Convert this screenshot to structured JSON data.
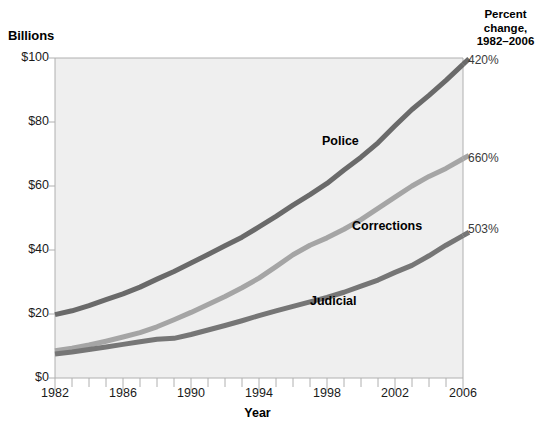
{
  "chart_data": {
    "type": "line",
    "title": "",
    "xlabel": "Year",
    "ylabel": "Billions",
    "xlim": [
      1982,
      2006
    ],
    "ylim": [
      0,
      100
    ],
    "grid": false,
    "legend_position": "inline-annotations",
    "x": [
      1982,
      1983,
      1984,
      1985,
      1986,
      1987,
      1988,
      1989,
      1990,
      1991,
      1992,
      1993,
      1994,
      1995,
      1996,
      1997,
      1998,
      1999,
      2000,
      2001,
      2002,
      2003,
      2004,
      2005,
      2006
    ],
    "y_tick_labels": [
      "$0",
      "$20",
      "$40",
      "$60",
      "$80",
      "$100"
    ],
    "y_tick_values": [
      0,
      20,
      40,
      60,
      80,
      100
    ],
    "x_tick_labels": [
      "1982",
      "1986",
      "1990",
      "1994",
      "1998",
      "2002",
      "2006"
    ],
    "x_tick_values": [
      1982,
      1986,
      1990,
      1994,
      1998,
      2002,
      2006
    ],
    "series": [
      {
        "name": "Police",
        "color": "#6a6a6a",
        "percent_change": "420%",
        "values": [
          19.8,
          21.0,
          22.6,
          24.5,
          26.3,
          28.4,
          30.9,
          33.3,
          35.9,
          38.6,
          41.3,
          44.0,
          47.2,
          50.5,
          54.0,
          57.3,
          60.8,
          65.0,
          69.0,
          73.5,
          78.8,
          83.9,
          88.3,
          93.0,
          98.0
        ]
      },
      {
        "name": "Corrections",
        "color": "#a5a5a5",
        "percent_change": "660%",
        "values": [
          8.5,
          9.3,
          10.3,
          11.5,
          12.8,
          14.2,
          16.0,
          18.2,
          20.5,
          23.0,
          25.5,
          28.2,
          31.2,
          34.8,
          38.5,
          41.5,
          43.8,
          46.5,
          49.5,
          53.0,
          56.5,
          60.0,
          63.0,
          65.5,
          68.5
        ]
      },
      {
        "name": "Judicial",
        "color": "#767676",
        "percent_change": "503%",
        "values": [
          7.5,
          8.1,
          8.9,
          9.7,
          10.5,
          11.3,
          12.1,
          12.4,
          13.6,
          15.0,
          16.4,
          17.9,
          19.5,
          21.0,
          22.4,
          23.8,
          25.2,
          26.8,
          28.7,
          30.6,
          33.0,
          35.2,
          38.2,
          41.5,
          44.5
        ]
      }
    ],
    "annotations": [
      {
        "text": "Police",
        "x_px": 322,
        "y_px": 134
      },
      {
        "text": "Corrections",
        "x_px": 352,
        "y_px": 219
      },
      {
        "text": "Judicial",
        "x_px": 310,
        "y_px": 294
      },
      {
        "text": "420%",
        "x_px": 468,
        "y_px": 53
      },
      {
        "text": "660%",
        "x_px": 468,
        "y_px": 151
      },
      {
        "text": "503%",
        "x_px": 468,
        "y_px": 222
      }
    ]
  },
  "axes": {
    "y_title": "Billions",
    "x_title": "Year"
  },
  "right_panel": {
    "header_line1": "Percent",
    "header_line2": "change,",
    "header_line3": "1982–2006"
  },
  "colors": {
    "plot_background": "#efefef",
    "axis_line": "#b0b0b0",
    "police": "#6a6a6a",
    "corrections": "#a5a5a5",
    "judicial": "#767676"
  }
}
